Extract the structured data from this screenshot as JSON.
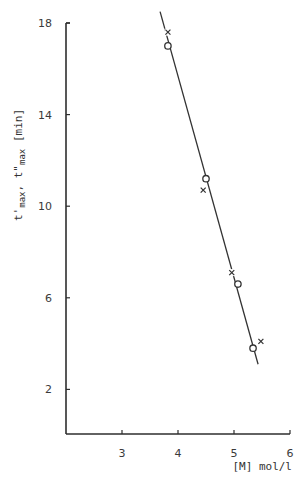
{
  "chart_data": {
    "type": "scatter",
    "title": "",
    "xlabel": "[M] mol/l",
    "ylabel": "t'max, t\"max [min]",
    "ylabel_parts": {
      "t1": "t'",
      "sub1": "max",
      "sep": ", ",
      "t2": "t\"",
      "sub2": "max",
      "unit": " [min]"
    },
    "xlim": [
      2,
      6
    ],
    "ylim": [
      0,
      18
    ],
    "xticks": [
      3,
      4,
      5,
      6
    ],
    "yticks": [
      2,
      6,
      10,
      14,
      18
    ],
    "grid": false,
    "legend": null,
    "series": [
      {
        "name": "t'max",
        "marker": "x",
        "points": [
          [
            3.82,
            17.6
          ],
          [
            4.45,
            10.7
          ],
          [
            4.96,
            7.1
          ],
          [
            5.48,
            4.1
          ]
        ]
      },
      {
        "name": "t\"max",
        "marker": "o",
        "points": [
          [
            3.82,
            17.0
          ],
          [
            4.5,
            11.2
          ],
          [
            5.07,
            6.6
          ],
          [
            5.34,
            3.8
          ]
        ]
      }
    ],
    "fit_line": {
      "x": [
        3.68,
        5.43
      ],
      "y": [
        18.5,
        3.1
      ]
    }
  }
}
